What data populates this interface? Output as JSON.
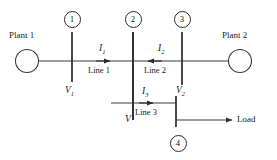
{
  "diagram": {
    "type": "single-line-diagram",
    "stroke_color": "#3a3a3a",
    "text_color": "#1a1a1a",
    "background_color": "#ffffff",
    "plants": [
      {
        "id": "plant-1",
        "label": "Plant 1",
        "cx": 27,
        "cy": 61,
        "r": 11
      },
      {
        "id": "plant-2",
        "label": "Plant 2",
        "cx": 240,
        "cy": 61,
        "r": 11
      }
    ],
    "bus_numbers": [
      {
        "id": "bus-num-1",
        "label": "1",
        "cx": 72,
        "cy": 19
      },
      {
        "id": "bus-num-2",
        "label": "2",
        "cx": 133,
        "cy": 19
      },
      {
        "id": "bus-num-3",
        "label": "3",
        "cx": 182,
        "cy": 19
      },
      {
        "id": "bus-num-4",
        "label": "4",
        "cx": 178,
        "cy": 143
      }
    ],
    "buses": [
      {
        "id": "bus-bar-1",
        "x": 72,
        "y1": 32,
        "y2": 82
      },
      {
        "id": "bus-bar-2",
        "x": 133,
        "y1": 32,
        "y2": 120
      },
      {
        "id": "bus-bar-3",
        "x": 182,
        "y1": 32,
        "y2": 85
      },
      {
        "id": "bus-bar-4",
        "x": 176,
        "y1": 96,
        "y2": 127
      }
    ],
    "lines": [
      {
        "id": "line-1",
        "label": "Line 1",
        "current": "I",
        "current_sub": "1",
        "direction": "right"
      },
      {
        "id": "line-2",
        "label": "Line 2",
        "current": "I",
        "current_sub": "2",
        "direction": "left"
      },
      {
        "id": "line-3",
        "label": "Line 3",
        "current": "I",
        "current_sub": "3",
        "direction": "right"
      }
    ],
    "voltages": [
      {
        "id": "voltage-1",
        "symbol": "V",
        "sub": "1"
      },
      {
        "id": "voltage-2",
        "symbol": "V",
        "sub": "2"
      },
      {
        "id": "voltage-bus2",
        "symbol": "V",
        "sub": ""
      }
    ],
    "load": {
      "id": "load",
      "label": "Load"
    }
  }
}
